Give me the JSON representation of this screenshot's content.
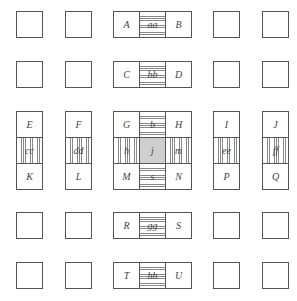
{
  "diagram": {
    "columns_x": [
      16,
      65,
      113,
      139,
      165,
      213,
      262
    ],
    "rows_y": [
      11,
      61,
      111,
      137,
      163,
      212,
      262
    ],
    "cell_size": 26,
    "colors": {
      "border": "#555555",
      "hatch": "#888888",
      "center_fill": "#cfcfcf",
      "text": "#444444"
    },
    "cells": [
      {
        "id": "r1c1",
        "x": 16,
        "y": 11,
        "label": "",
        "fill": "plain"
      },
      {
        "id": "r1c2",
        "x": 65,
        "y": 11,
        "label": "",
        "fill": "plain"
      },
      {
        "id": "A",
        "x": 113,
        "y": 11,
        "label": "A",
        "fill": "plain"
      },
      {
        "id": "aa",
        "x": 139,
        "y": 11,
        "label": "aa",
        "fill": "hstripe"
      },
      {
        "id": "B",
        "x": 165,
        "y": 11,
        "label": "B",
        "fill": "plain"
      },
      {
        "id": "r1c6",
        "x": 213,
        "y": 11,
        "label": "",
        "fill": "plain"
      },
      {
        "id": "r1c7",
        "x": 262,
        "y": 11,
        "label": "",
        "fill": "plain"
      },
      {
        "id": "r2c1",
        "x": 16,
        "y": 61,
        "label": "",
        "fill": "plain"
      },
      {
        "id": "r2c2",
        "x": 65,
        "y": 61,
        "label": "",
        "fill": "plain"
      },
      {
        "id": "C",
        "x": 113,
        "y": 61,
        "label": "C",
        "fill": "plain"
      },
      {
        "id": "bb",
        "x": 139,
        "y": 61,
        "label": "bb",
        "fill": "hstripe"
      },
      {
        "id": "D",
        "x": 165,
        "y": 61,
        "label": "D",
        "fill": "plain"
      },
      {
        "id": "r2c6",
        "x": 213,
        "y": 61,
        "label": "",
        "fill": "plain"
      },
      {
        "id": "r2c7",
        "x": 262,
        "y": 61,
        "label": "",
        "fill": "plain"
      },
      {
        "id": "E",
        "x": 16,
        "y": 111,
        "label": "E",
        "fill": "plain"
      },
      {
        "id": "cc",
        "x": 16,
        "y": 137,
        "label": "cc",
        "fill": "vstripe"
      },
      {
        "id": "K",
        "x": 16,
        "y": 163,
        "label": "K",
        "fill": "plain"
      },
      {
        "id": "F",
        "x": 65,
        "y": 111,
        "label": "F",
        "fill": "plain"
      },
      {
        "id": "dd",
        "x": 65,
        "y": 137,
        "label": "dd",
        "fill": "vstripe"
      },
      {
        "id": "L",
        "x": 65,
        "y": 163,
        "label": "L",
        "fill": "plain"
      },
      {
        "id": "G",
        "x": 113,
        "y": 111,
        "label": "G",
        "fill": "plain"
      },
      {
        "id": "b",
        "x": 139,
        "y": 111,
        "label": "b",
        "fill": "hstripe"
      },
      {
        "id": "H",
        "x": 165,
        "y": 111,
        "label": "H",
        "fill": "plain"
      },
      {
        "id": "h",
        "x": 113,
        "y": 137,
        "label": "h",
        "fill": "vstripe"
      },
      {
        "id": "j",
        "x": 139,
        "y": 137,
        "label": "j",
        "fill": "gray"
      },
      {
        "id": "m",
        "x": 165,
        "y": 137,
        "label": "m",
        "fill": "vstripe"
      },
      {
        "id": "M",
        "x": 113,
        "y": 163,
        "label": "M",
        "fill": "plain"
      },
      {
        "id": "s",
        "x": 139,
        "y": 163,
        "label": "s",
        "fill": "hstripe"
      },
      {
        "id": "N",
        "x": 165,
        "y": 163,
        "label": "N",
        "fill": "plain"
      },
      {
        "id": "I",
        "x": 213,
        "y": 111,
        "label": "I",
        "fill": "plain"
      },
      {
        "id": "ee",
        "x": 213,
        "y": 137,
        "label": "ee",
        "fill": "vstripe"
      },
      {
        "id": "P",
        "x": 213,
        "y": 163,
        "label": "P",
        "fill": "plain"
      },
      {
        "id": "J",
        "x": 262,
        "y": 111,
        "label": "J",
        "fill": "plain"
      },
      {
        "id": "ff",
        "x": 262,
        "y": 137,
        "label": "ff",
        "fill": "vstripe"
      },
      {
        "id": "Q",
        "x": 262,
        "y": 163,
        "label": "Q",
        "fill": "plain"
      },
      {
        "id": "r4c1",
        "x": 16,
        "y": 212,
        "label": "",
        "fill": "plain"
      },
      {
        "id": "r4c2",
        "x": 65,
        "y": 212,
        "label": "",
        "fill": "plain"
      },
      {
        "id": "R",
        "x": 113,
        "y": 212,
        "label": "R",
        "fill": "plain"
      },
      {
        "id": "gg",
        "x": 139,
        "y": 212,
        "label": "gg",
        "fill": "hstripe"
      },
      {
        "id": "S",
        "x": 165,
        "y": 212,
        "label": "S",
        "fill": "plain"
      },
      {
        "id": "r4c6",
        "x": 213,
        "y": 212,
        "label": "",
        "fill": "plain"
      },
      {
        "id": "r4c7",
        "x": 262,
        "y": 212,
        "label": "",
        "fill": "plain"
      },
      {
        "id": "r5c1",
        "x": 16,
        "y": 262,
        "label": "",
        "fill": "plain"
      },
      {
        "id": "r5c2",
        "x": 65,
        "y": 262,
        "label": "",
        "fill": "plain"
      },
      {
        "id": "T",
        "x": 113,
        "y": 262,
        "label": "T",
        "fill": "plain"
      },
      {
        "id": "hh",
        "x": 139,
        "y": 262,
        "label": "hh",
        "fill": "hstripe"
      },
      {
        "id": "U",
        "x": 165,
        "y": 262,
        "label": "U",
        "fill": "plain"
      },
      {
        "id": "r5c6",
        "x": 213,
        "y": 262,
        "label": "",
        "fill": "plain"
      },
      {
        "id": "r5c7",
        "x": 262,
        "y": 262,
        "label": "",
        "fill": "plain"
      }
    ]
  }
}
